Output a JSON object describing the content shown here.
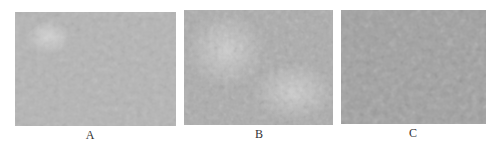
{
  "figure": {
    "panels": [
      {
        "id": "A",
        "label": "A",
        "base_color": "#b4b4b4",
        "description": "micrograph with a lighter granular cluster in the upper-left region on a uniform gray background"
      },
      {
        "id": "B",
        "label": "B",
        "base_color": "#aeaeae",
        "description": "micrograph with light granular clusters in the upper-left and lower-right regions"
      },
      {
        "id": "C",
        "label": "C",
        "base_color": "#a2a2a2",
        "description": "micrograph with darker, dense mottled texture across the whole field"
      }
    ]
  }
}
